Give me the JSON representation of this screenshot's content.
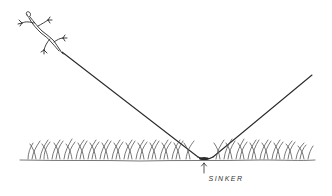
{
  "illustration": {
    "subject": "lizard on fishing line with sinker in grass",
    "labels": {
      "sinker": "SINKER"
    },
    "colors": {
      "ink": "#2b2b2b",
      "grass": "#555555",
      "background": "#ffffff"
    }
  }
}
